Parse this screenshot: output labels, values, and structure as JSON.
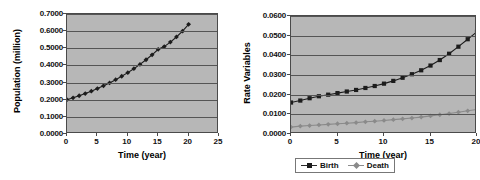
{
  "charts": [
    {
      "id": "population",
      "title": "",
      "xlabel": "Time (year)",
      "ylabel": "Population (million)",
      "xticks": [
        "0",
        "5",
        "10",
        "15",
        "20",
        "25"
      ],
      "yticks": [
        "0.0000",
        "0.1000",
        "0.2000",
        "0.3000",
        "0.4000",
        "0.5000",
        "0.6000",
        "0.7000"
      ]
    },
    {
      "id": "rates",
      "title": "",
      "xlabel": "Time (year)",
      "ylabel": "Rate Variables",
      "xticks": [
        "0",
        "5",
        "10",
        "15",
        "20"
      ],
      "yticks": [
        "0.0000",
        "0.0100",
        "0.0200",
        "0.0300",
        "0.0400",
        "0.0500",
        "0.0600"
      ],
      "legend": [
        {
          "label": "Birth",
          "color": "#1c1c1c"
        },
        {
          "label": "Death",
          "color": "#8a8a8a"
        }
      ]
    }
  ],
  "chart_data": [
    {
      "type": "line",
      "id": "population",
      "title": "",
      "xlabel": "Time (year)",
      "ylabel": "Population (million)",
      "xlim": [
        0,
        25
      ],
      "ylim": [
        0.0,
        0.7
      ],
      "xticks": [
        0,
        5,
        10,
        15,
        20,
        25
      ],
      "yticks": [
        0.0,
        0.1,
        0.2,
        0.3,
        0.4,
        0.5,
        0.6,
        0.7
      ],
      "grid": true,
      "legend": null,
      "marker": "filled-diamond",
      "color": "#1c1c1c",
      "x": [
        0,
        1,
        2,
        3,
        4,
        5,
        6,
        7,
        8,
        9,
        10,
        11,
        12,
        13,
        14,
        15,
        16,
        17,
        18,
        19,
        20
      ],
      "series": [
        {
          "name": "Population",
          "values": [
            0.2,
            0.211,
            0.223,
            0.236,
            0.25,
            0.265,
            0.281,
            0.298,
            0.317,
            0.337,
            0.358,
            0.381,
            0.406,
            0.433,
            0.462,
            0.494,
            0.51,
            0.536,
            0.566,
            0.6,
            0.64
          ]
        }
      ]
    },
    {
      "type": "line",
      "id": "rates",
      "title": "",
      "xlabel": "Time (year)",
      "ylabel": "Rate Variables",
      "xlim": [
        0,
        20
      ],
      "ylim": [
        0.0,
        0.06
      ],
      "xticks": [
        0,
        5,
        10,
        15,
        20
      ],
      "yticks": [
        0.0,
        0.01,
        0.02,
        0.03,
        0.04,
        0.05,
        0.06
      ],
      "grid": true,
      "legend_position": "bottom",
      "x": [
        0,
        1,
        2,
        3,
        4,
        5,
        6,
        7,
        8,
        9,
        10,
        11,
        12,
        13,
        14,
        15,
        16,
        17,
        18,
        19,
        20
      ],
      "series": [
        {
          "name": "Birth",
          "marker": "filled-square",
          "color": "#1c1c1c",
          "values": [
            0.016,
            0.017,
            0.0182,
            0.0192,
            0.02,
            0.0208,
            0.0216,
            0.0224,
            0.0234,
            0.0244,
            0.0256,
            0.027,
            0.0286,
            0.0304,
            0.0324,
            0.0348,
            0.0376,
            0.0408,
            0.0444,
            0.0482,
            0.052
          ]
        },
        {
          "name": "Death",
          "marker": "filled-diamond",
          "color": "#8a8a8a",
          "values": [
            0.0035,
            0.004,
            0.0043,
            0.0046,
            0.0049,
            0.0052,
            0.0055,
            0.0058,
            0.0062,
            0.0065,
            0.0069,
            0.0073,
            0.0077,
            0.0081,
            0.0086,
            0.0092,
            0.0098,
            0.0104,
            0.0111,
            0.0118,
            0.0125
          ]
        }
      ]
    }
  ]
}
